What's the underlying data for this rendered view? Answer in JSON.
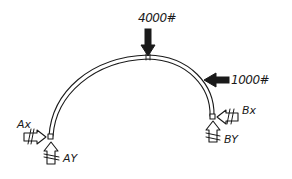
{
  "diagram": {
    "structure": "semicircular arch, pinned at both ends",
    "applied_loads": [
      {
        "id": "vertical-load",
        "label": "4000#",
        "direction": "down",
        "location": "crown"
      },
      {
        "id": "horizontal-load",
        "label": "1000#",
        "direction": "left",
        "location": "right haunch"
      }
    ],
    "reactions": [
      {
        "id": "ax",
        "label": "Ax",
        "direction": "right",
        "support": "A"
      },
      {
        "id": "ay",
        "label": "AY",
        "direction": "up",
        "support": "A"
      },
      {
        "id": "bx",
        "label": "Bx",
        "direction": "left",
        "support": "B"
      },
      {
        "id": "by",
        "label": "BY",
        "direction": "up",
        "support": "B"
      }
    ],
    "colors": {
      "ink": "#1a1a1a",
      "paper": "#ffffff"
    }
  }
}
